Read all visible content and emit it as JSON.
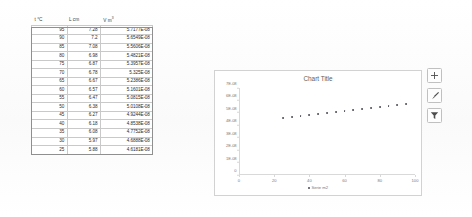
{
  "sheet": {
    "headers": [
      {
        "text": "t",
        "unit": "°C",
        "sup": ""
      },
      {
        "text": "L",
        "unit": "cm",
        "sup": ""
      },
      {
        "text": "V",
        "unit": "m",
        "sup": "3"
      }
    ],
    "header_labels": [
      "t °C",
      "L cm",
      "V m3"
    ],
    "rows": [
      {
        "t": "95",
        "l": "7.28",
        "v": "5.7177E-08"
      },
      {
        "t": "90",
        "l": "7.2",
        "v": "5.6549E-08"
      },
      {
        "t": "85",
        "l": "7.08",
        "v": "5.5606E-08"
      },
      {
        "t": "80",
        "l": "6.98",
        "v": "5.4821E-08"
      },
      {
        "t": "75",
        "l": "6.87",
        "v": "5.3957E-08"
      },
      {
        "t": "70",
        "l": "6.78",
        "v": "5.325E-08"
      },
      {
        "t": "65",
        "l": "6.67",
        "v": "5.2386E-08"
      },
      {
        "t": "60",
        "l": "6.57",
        "v": "5.1601E-08"
      },
      {
        "t": "55",
        "l": "6.47",
        "v": "5.0815E-08"
      },
      {
        "t": "50",
        "l": "6.38",
        "v": "5.0108E-08"
      },
      {
        "t": "45",
        "l": "6.27",
        "v": "4.9244E-08"
      },
      {
        "t": "40",
        "l": "6.18",
        "v": "4.8538E-08"
      },
      {
        "t": "35",
        "l": "6.08",
        "v": "4.7752E-08"
      },
      {
        "t": "30",
        "l": "5.97",
        "v": "4.6888E-08"
      },
      {
        "t": "25",
        "l": "5.88",
        "v": "4.6181E-08"
      }
    ]
  },
  "chart": {
    "title": "Chart Title",
    "legend_label": "Serie m2",
    "tools": [
      {
        "name": "chart-elements",
        "glyph": "plus"
      },
      {
        "name": "chart-styles",
        "glyph": "brush"
      },
      {
        "name": "chart-filters",
        "glyph": "funnel"
      }
    ]
  },
  "chart_data": {
    "type": "scatter",
    "title": "Chart Title",
    "xlabel": "",
    "ylabel": "",
    "xlim": [
      0,
      100
    ],
    "ylim": [
      0,
      7e-08
    ],
    "xticks": [
      0,
      20,
      40,
      60,
      80,
      100
    ],
    "yticks": [
      0,
      1e-08,
      2e-08,
      3e-08,
      4e-08,
      5e-08,
      6e-08,
      7e-08
    ],
    "ytick_labels": [
      "0",
      "1E-08",
      "2E-08",
      "3E-08",
      "4E-08",
      "5E-08",
      "6E-08",
      "7E-08"
    ],
    "xtick_labels": [
      "0",
      "20",
      "40",
      "60",
      "80",
      "100"
    ],
    "grid": false,
    "legend_position": "bottom",
    "series": [
      {
        "name": "Serie m2",
        "marker": "circle",
        "color": "#4a4a52",
        "x": [
          25,
          30,
          35,
          40,
          45,
          50,
          55,
          60,
          65,
          70,
          75,
          80,
          85,
          90,
          95
        ],
        "y": [
          4.6181e-08,
          4.6888e-08,
          4.7752e-08,
          4.8538e-08,
          4.9244e-08,
          5.0108e-08,
          5.0815e-08,
          5.1601e-08,
          5.2386e-08,
          5.325e-08,
          5.3957e-08,
          5.4821e-08,
          5.5606e-08,
          5.6549e-08,
          5.7177e-08
        ]
      }
    ]
  }
}
